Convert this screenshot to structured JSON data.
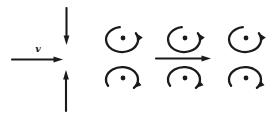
{
  "figure": {
    "background": "#ffffff",
    "ink_color": "#1a1a1a",
    "left_panel": {
      "velocity_label": "v",
      "arrows": [
        {
          "id": "velocity-arrow",
          "direction": "right"
        },
        {
          "id": "downward-arrow",
          "direction": "down"
        },
        {
          "id": "upward-arrow",
          "direction": "up"
        }
      ]
    },
    "right_panel": {
      "flow_arrow": {
        "direction": "right"
      },
      "vortex_grid": {
        "columns": 3,
        "rows": [
          {
            "rotation": "counterclockwise",
            "marker": "dot"
          },
          {
            "rotation": "clockwise",
            "marker": "dot"
          }
        ]
      }
    }
  }
}
